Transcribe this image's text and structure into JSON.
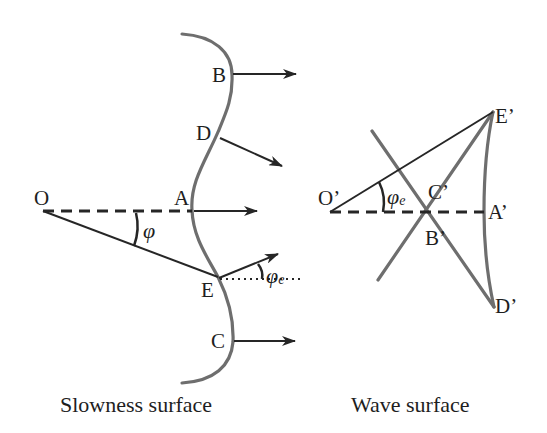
{
  "slowness_panel": {
    "caption": "Slowness surface",
    "points": {
      "O": "O",
      "A": "A",
      "B": "B",
      "C": "C",
      "D": "D",
      "E": "E"
    },
    "angles": {
      "phi": "φ",
      "phi_e_symbol": "φ",
      "phi_e_subscript": "e"
    },
    "arrows": [
      "B",
      "D",
      "A",
      "E",
      "C"
    ]
  },
  "wave_panel": {
    "caption": "Wave surface",
    "points": {
      "O_prime": "O’",
      "A_prime": "A’",
      "B_prime": "B’",
      "C_prime": "C’",
      "D_prime": "D’",
      "E_prime": "E’"
    },
    "angles": {
      "phi_e_symbol": "φ",
      "phi_e_subscript": "e"
    }
  },
  "colors": {
    "curve": "#6e6e6e",
    "ink": "#262626",
    "background": "#ffffff"
  }
}
